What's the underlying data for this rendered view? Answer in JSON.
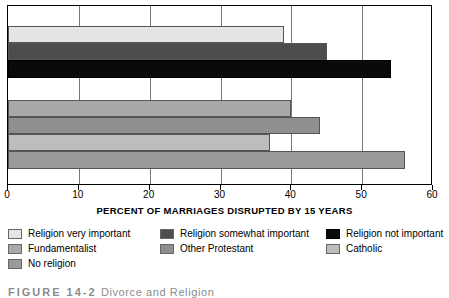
{
  "chart_data": {
    "type": "bar",
    "orientation": "horizontal",
    "title": "",
    "xlabel": "PERCENT OF MARRIAGES DISRUPTED BY 15 YEARS",
    "ylabel": "",
    "xlim": [
      0,
      60
    ],
    "xticks": [
      0,
      10,
      20,
      30,
      40,
      50,
      60
    ],
    "xtick_labels": [
      "0",
      "10",
      "20",
      "30",
      "40",
      "50",
      "60"
    ],
    "grid": true,
    "grid_axis": "x",
    "legend_position": "below",
    "categories": [
      "Religion very important",
      "Religion somewhat important",
      "Religion not important",
      "Fundamentalist",
      "Other Protestant",
      "Catholic",
      "No religion"
    ],
    "values": [
      39,
      45,
      54,
      40,
      44,
      37,
      56
    ],
    "colors": [
      "#e4e4e4",
      "#4d4d4d",
      "#0a0a0a",
      "#a9a9a9",
      "#8f8f8f",
      "#bdbdbd",
      "#9a9a9a"
    ],
    "series": [
      {
        "name": "Percent of marriages disrupted by 15 years",
        "values": [
          39,
          45,
          54,
          40,
          44,
          37,
          56
        ]
      }
    ],
    "groups": [
      {
        "name": "Religious importance",
        "categories": [
          "Religion very important",
          "Religion somewhat important",
          "Religion not important"
        ]
      },
      {
        "name": "Religious affiliation",
        "categories": [
          "Fundamentalist",
          "Other Protestant",
          "Catholic",
          "No religion"
        ]
      }
    ]
  },
  "axis": {
    "x_title": "PERCENT OF MARRIAGES DISRUPTED BY 15 YEARS",
    "ticks": [
      "0",
      "10",
      "20",
      "30",
      "40",
      "50",
      "60"
    ]
  },
  "legend": {
    "items": [
      {
        "label": "Religion very important",
        "color": "#e4e4e4"
      },
      {
        "label": "Religion somewhat important",
        "color": "#4d4d4d"
      },
      {
        "label": "Religion not important",
        "color": "#0a0a0a"
      },
      {
        "label": "Fundamentalist",
        "color": "#a9a9a9"
      },
      {
        "label": "Other Protestant",
        "color": "#8f8f8f"
      },
      {
        "label": "Catholic",
        "color": "#bdbdbd"
      },
      {
        "label": "No religion",
        "color": "#9a9a9a"
      }
    ]
  },
  "caption": {
    "number": "FIGURE 14-2",
    "text": "Divorce and Religion"
  }
}
